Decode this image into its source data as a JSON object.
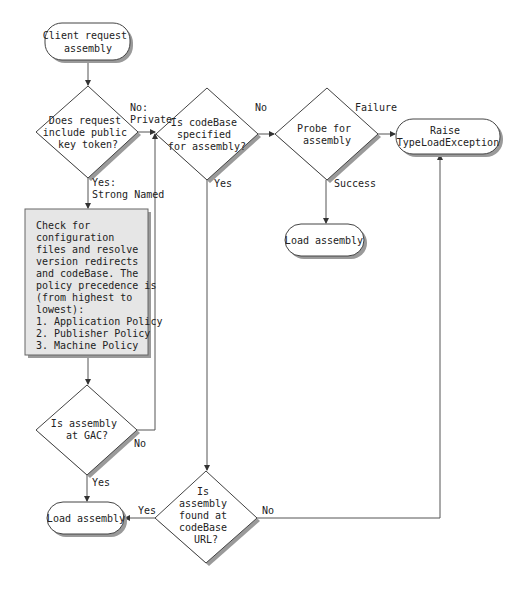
{
  "diagram": {
    "type": "flowchart",
    "nodes": {
      "start": {
        "lines": [
          "Client request",
          "assembly"
        ]
      },
      "q_public_key": {
        "lines": [
          "Does request",
          "include public",
          "key token?"
        ]
      },
      "q_codebase": {
        "lines": [
          "Is codeBase",
          "specified",
          "for assembly?"
        ]
      },
      "probe": {
        "lines": [
          "Probe for",
          "assembly"
        ]
      },
      "raise": {
        "lines": [
          "Raise",
          "TypeLoadException"
        ]
      },
      "load_probe": {
        "lines": [
          "Load assembly"
        ]
      },
      "config_box": {
        "lines": [
          "Check for",
          "configuration",
          "files and resolve",
          "version redirects",
          "and codeBase. The",
          "policy precedence is",
          "(from highest to",
          "lowest):",
          "1. Application Policy",
          "2. Publisher Policy",
          "3. Machine Policy"
        ]
      },
      "q_gac": {
        "lines": [
          "Is assembly",
          "at GAC?"
        ]
      },
      "load_gac": {
        "lines": [
          "Load assembly"
        ]
      },
      "q_url": {
        "lines": [
          "Is",
          "assembly",
          "found at",
          "codeBase",
          "URL?"
        ]
      }
    },
    "edge_labels": {
      "no_private": [
        "No:",
        "Private"
      ],
      "yes_strong": [
        "Yes:",
        "Strong Named"
      ],
      "codebase_no": "No",
      "codebase_yes": "Yes",
      "probe_failure": "Failure",
      "probe_success": "Success",
      "gac_no": "No",
      "gac_yes": "Yes",
      "url_yes": "Yes",
      "url_no": "No"
    },
    "colors": {
      "line": "#444444",
      "shadow": "#9a9a9a",
      "process_fill": "#e6e6e6",
      "node_fill": "#ffffff"
    }
  }
}
